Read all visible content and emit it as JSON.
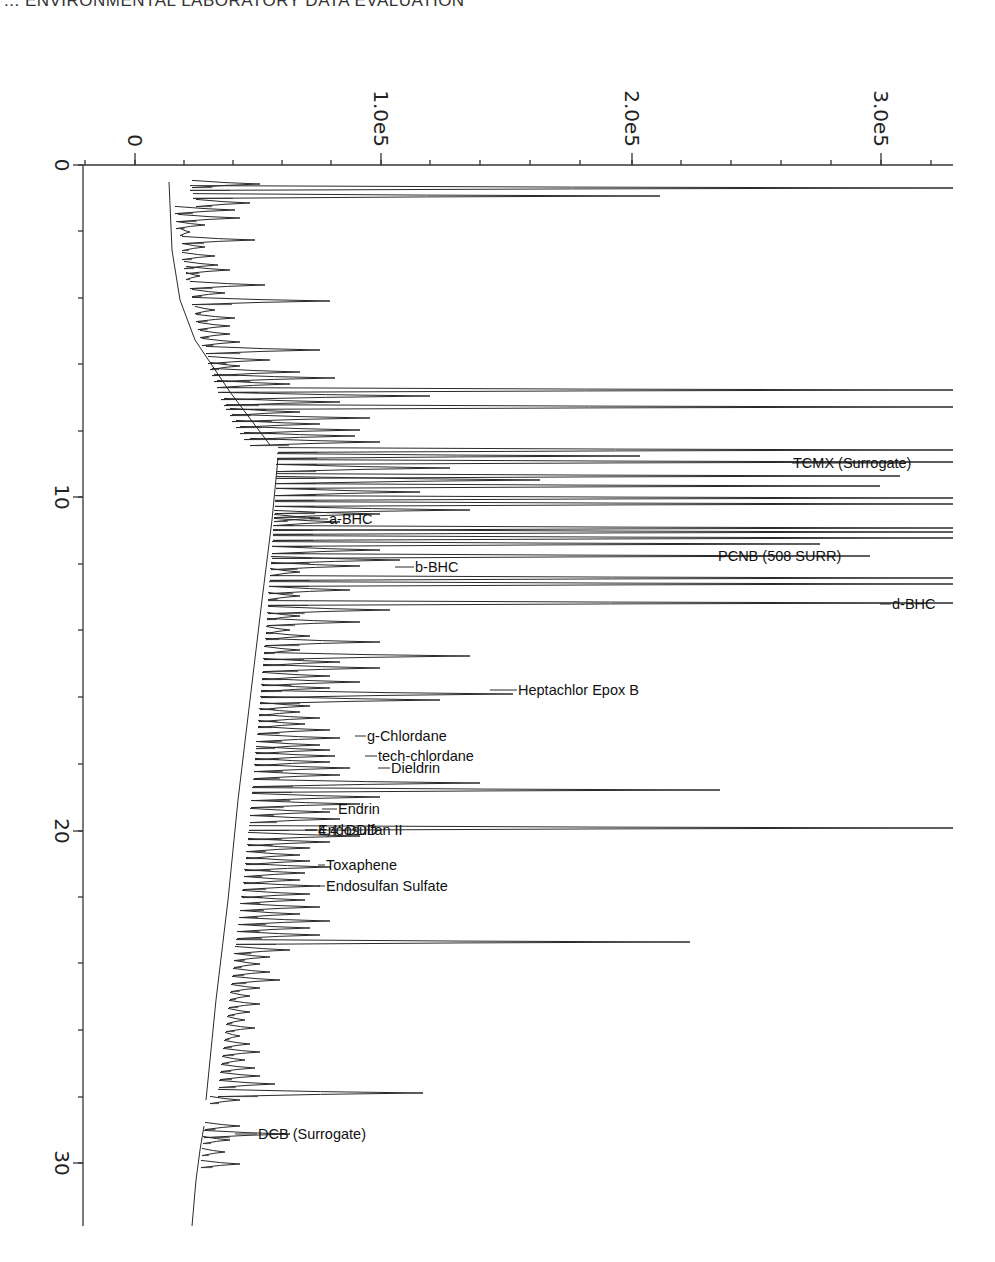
{
  "header": {
    "title": "... ENVIRONMENTAL LABORATORY DATA EVALUATION"
  },
  "chart_data": {
    "type": "line",
    "orientation": "rotated-90",
    "xlabel": "Retention time (min)",
    "ylabel": "Response",
    "xlim": [
      0,
      32
    ],
    "ylim": [
      -20000.0,
      330000.0
    ],
    "grid": false,
    "time_ticks": [
      "0",
      "10",
      "20",
      "30"
    ],
    "response_ticks": [
      "0",
      "1.0e5",
      "2.0e5",
      "3.0e5"
    ],
    "peaks_labeled": [
      {
        "name": "TCMX (Surrogate)",
        "rt": 8.8,
        "response": 330000.0
      },
      {
        "name": "a-BHC",
        "rt": 10.6,
        "response": 60000.0
      },
      {
        "name": "PCNB (508 SURR)",
        "rt": 11.7,
        "response": 230000.0
      },
      {
        "name": "b-BHC",
        "rt": 12.2,
        "response": 95000.0
      },
      {
        "name": "d-BHC",
        "rt": 13.3,
        "response": 320000.0
      },
      {
        "name": "Heptachlor Epox B",
        "rt": 15.8,
        "response": 155000.0
      },
      {
        "name": "g-Chlordane",
        "rt": 17.2,
        "response": 85000.0
      },
      {
        "name": "tech-chlordane",
        "rt": 17.8,
        "response": 90000.0
      },
      {
        "name": "Dieldrin",
        "rt": 18.1,
        "response": 93000.0
      },
      {
        "name": "Endrin",
        "rt": 19.5,
        "response": 75000.0
      },
      {
        "name": "4,4'-DDD",
        "rt": 19.9,
        "response": 68000.0
      },
      {
        "name": "Endosulfan II",
        "rt": 20.0,
        "response": 68000.0
      },
      {
        "name": "Toxaphene",
        "rt": 21.0,
        "response": 70000.0
      },
      {
        "name": "Endosulfan Sulfate",
        "rt": 21.7,
        "response": 72000.0
      },
      {
        "name": "DCB (Surrogate)",
        "rt": 29.0,
        "response": 38000.0
      }
    ]
  },
  "plot": {
    "frame": {
      "left": 83,
      "top": 165,
      "right": 953,
      "bottom": 1226
    },
    "axis_color": "#333333",
    "trace_color": "#2a2a2a",
    "x_axis": {
      "zero_px": 135,
      "px_per_unit": 0.002475,
      "ticks_px": [
        85,
        135,
        184,
        233,
        282,
        331,
        381,
        430,
        480,
        530,
        580,
        632,
        681,
        731,
        781,
        831,
        881,
        931
      ],
      "major": [
        {
          "px": 135,
          "label": "0"
        },
        {
          "px": 381,
          "label": "1.0e5"
        },
        {
          "px": 632,
          "label": "2.0e5"
        },
        {
          "px": 881,
          "label": "3.0e5"
        }
      ]
    },
    "y_axis": {
      "ticks_px": [
        165,
        231,
        298,
        364,
        431,
        497,
        564,
        630,
        697,
        764,
        831,
        897,
        963,
        1030,
        1097,
        1163
      ],
      "major": [
        {
          "px": 165,
          "label": "0"
        },
        {
          "px": 497,
          "label": "10"
        },
        {
          "px": 831,
          "label": "20"
        },
        {
          "px": 1163,
          "label": "30"
        }
      ]
    },
    "baseline": [
      [
        [
          169,
          182
        ],
        [
          172,
          250
        ],
        [
          180,
          300
        ],
        [
          195,
          340
        ],
        [
          230,
          392
        ],
        [
          270,
          445
        ]
      ],
      [
        [
          278,
          458
        ],
        [
          272,
          520
        ],
        [
          262,
          600
        ],
        [
          250,
          700
        ],
        [
          238,
          800
        ],
        [
          228,
          900
        ],
        [
          216,
          1000
        ],
        [
          206,
          1100
        ]
      ],
      [
        [
          204,
          1126
        ],
        [
          200,
          1150
        ],
        [
          196,
          1180
        ],
        [
          192,
          1226
        ]
      ]
    ],
    "peaks": [
      [
        184,
        192,
        260
      ],
      [
        188,
        190,
        953
      ],
      [
        196,
        193,
        660
      ],
      [
        203,
        196,
        250
      ],
      [
        210,
        175,
        235
      ],
      [
        218,
        178,
        240
      ],
      [
        225,
        176,
        205
      ],
      [
        232,
        180,
        190
      ],
      [
        240,
        182,
        255
      ],
      [
        247,
        182,
        205
      ],
      [
        256,
        182,
        215
      ],
      [
        265,
        184,
        218
      ],
      [
        270,
        186,
        230
      ],
      [
        276,
        186,
        200
      ],
      [
        285,
        190,
        265
      ],
      [
        293,
        192,
        225
      ],
      [
        301,
        192,
        330
      ],
      [
        310,
        195,
        215
      ],
      [
        318,
        196,
        235
      ],
      [
        326,
        198,
        230
      ],
      [
        334,
        200,
        230
      ],
      [
        342,
        202,
        240
      ],
      [
        350,
        206,
        320
      ],
      [
        360,
        208,
        270
      ],
      [
        366,
        210,
        240
      ],
      [
        372,
        212,
        300
      ],
      [
        378,
        214,
        335
      ],
      [
        384,
        217,
        290
      ],
      [
        390,
        218,
        953
      ],
      [
        396,
        221,
        430
      ],
      [
        402,
        224,
        340
      ],
      [
        407,
        226,
        953
      ],
      [
        412,
        230,
        300
      ],
      [
        418,
        232,
        370
      ],
      [
        424,
        236,
        320
      ],
      [
        430,
        240,
        360
      ],
      [
        436,
        244,
        355
      ],
      [
        442,
        250,
        380
      ],
      [
        450,
        278,
        953
      ],
      [
        456,
        277,
        640
      ],
      [
        462,
        277,
        953
      ],
      [
        468,
        276,
        450
      ],
      [
        476,
        276,
        900
      ],
      [
        480,
        276,
        540
      ],
      [
        486,
        276,
        880
      ],
      [
        492,
        276,
        420
      ],
      [
        498,
        275,
        953
      ],
      [
        504,
        275,
        953
      ],
      [
        510,
        275,
        470
      ],
      [
        514,
        274,
        380
      ],
      [
        518,
        274,
        320
      ],
      [
        522,
        274,
        340
      ],
      [
        528,
        273,
        953
      ],
      [
        532,
        273,
        953
      ],
      [
        538,
        273,
        953
      ],
      [
        544,
        272,
        820
      ],
      [
        550,
        272,
        380
      ],
      [
        556,
        272,
        870
      ],
      [
        560,
        271,
        400
      ],
      [
        566,
        271,
        360
      ],
      [
        572,
        270,
        300
      ],
      [
        578,
        270,
        953
      ],
      [
        584,
        269,
        953
      ],
      [
        590,
        269,
        350
      ],
      [
        596,
        268,
        300
      ],
      [
        603,
        268,
        953
      ],
      [
        610,
        268,
        390
      ],
      [
        616,
        267,
        300
      ],
      [
        622,
        267,
        360
      ],
      [
        630,
        266,
        290
      ],
      [
        636,
        266,
        310
      ],
      [
        642,
        265,
        380
      ],
      [
        650,
        264,
        300
      ],
      [
        656,
        264,
        470
      ],
      [
        662,
        263,
        340
      ],
      [
        668,
        263,
        380
      ],
      [
        676,
        262,
        330
      ],
      [
        682,
        262,
        360
      ],
      [
        688,
        261,
        330
      ],
      [
        694,
        261,
        513
      ],
      [
        700,
        260,
        440
      ],
      [
        706,
        260,
        310
      ],
      [
        712,
        259,
        300
      ],
      [
        718,
        259,
        320
      ],
      [
        724,
        258,
        305
      ],
      [
        730,
        258,
        330
      ],
      [
        738,
        257,
        340
      ],
      [
        745,
        256,
        320
      ],
      [
        750,
        256,
        330
      ],
      [
        756,
        255,
        335
      ],
      [
        762,
        255,
        330
      ],
      [
        768,
        254,
        350
      ],
      [
        775,
        254,
        340
      ],
      [
        783,
        253,
        480
      ],
      [
        790,
        252,
        720
      ],
      [
        797,
        252,
        380
      ],
      [
        804,
        251,
        360
      ],
      [
        812,
        250,
        330
      ],
      [
        819,
        250,
        340
      ],
      [
        828,
        249,
        953
      ],
      [
        836,
        248,
        360
      ],
      [
        842,
        248,
        330
      ],
      [
        848,
        247,
        310
      ],
      [
        855,
        246,
        300
      ],
      [
        861,
        246,
        310
      ],
      [
        867,
        245,
        330
      ],
      [
        873,
        244,
        305
      ],
      [
        880,
        244,
        300
      ],
      [
        886,
        243,
        320
      ],
      [
        894,
        242,
        310
      ],
      [
        900,
        241,
        305
      ],
      [
        907,
        240,
        320
      ],
      [
        914,
        240,
        300
      ],
      [
        921,
        239,
        330
      ],
      [
        928,
        238,
        310
      ],
      [
        935,
        237,
        320
      ],
      [
        942,
        236,
        690
      ],
      [
        950,
        235,
        290
      ],
      [
        957,
        234,
        270
      ],
      [
        964,
        234,
        260
      ],
      [
        972,
        233,
        270
      ],
      [
        980,
        232,
        280
      ],
      [
        988,
        231,
        260
      ],
      [
        996,
        230,
        250
      ],
      [
        1004,
        229,
        260
      ],
      [
        1012,
        228,
        250
      ],
      [
        1020,
        227,
        245
      ],
      [
        1028,
        226,
        255
      ],
      [
        1036,
        225,
        240
      ],
      [
        1044,
        224,
        250
      ],
      [
        1052,
        223,
        260
      ],
      [
        1060,
        222,
        245
      ],
      [
        1068,
        221,
        255
      ],
      [
        1076,
        220,
        260
      ],
      [
        1084,
        219,
        275
      ],
      [
        1093,
        218,
        423
      ],
      [
        1100,
        210,
        240
      ],
      [
        1126,
        205,
        240
      ],
      [
        1134,
        204,
        290
      ],
      [
        1140,
        203,
        230
      ],
      [
        1152,
        202,
        225
      ],
      [
        1164,
        201,
        240
      ]
    ],
    "labels": [
      {
        "text": "TCMX (Surrogate)",
        "x": 792,
        "y": 468,
        "lead_from": 900
      },
      {
        "text": "a-BHC",
        "x": 328,
        "y": 524,
        "lead_from": 310
      },
      {
        "text": "PCNB (508 SURR)",
        "x": 717,
        "y": 561,
        "lead_from": 700
      },
      {
        "text": "b-BHC",
        "x": 414,
        "y": 572,
        "lead_from": 395
      },
      {
        "text": "d-BHC",
        "x": 891,
        "y": 609,
        "lead_from": 880
      },
      {
        "text": "Heptachlor Epox B",
        "x": 517,
        "y": 695,
        "lead_from": 490
      },
      {
        "text": "g-Chlordane",
        "x": 366,
        "y": 741,
        "lead_from": 355
      },
      {
        "text": "tech-chlordane",
        "x": 377,
        "y": 761,
        "lead_from": 365
      },
      {
        "text": "Dieldrin",
        "x": 390,
        "y": 773,
        "lead_from": 378
      },
      {
        "text": "Endrin",
        "x": 337,
        "y": 814,
        "lead_from": 322
      },
      {
        "text": "4,4'-DDD",
        "x": 317,
        "y": 835,
        "lead_from": 305
      },
      {
        "text": "Endosulfan II",
        "x": 317,
        "y": 835,
        "lead_from": 305
      },
      {
        "text": "Toxaphene",
        "x": 325,
        "y": 870,
        "lead_from": 318
      },
      {
        "text": "Endosulfan Sulfate",
        "x": 325,
        "y": 891,
        "lead_from": 318
      },
      {
        "text": "DCB (Surrogate)",
        "x": 257,
        "y": 1139,
        "lead_from": 235
      }
    ]
  }
}
